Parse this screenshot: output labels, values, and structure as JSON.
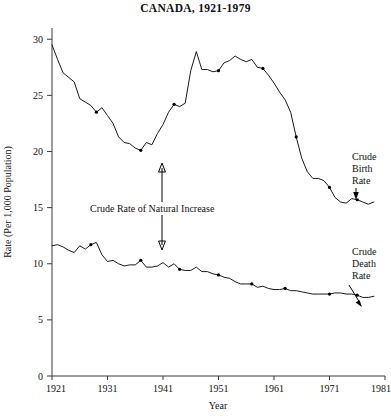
{
  "chart_data": {
    "type": "line",
    "title": "CANADA, 1921-1979",
    "xlabel": "Year",
    "ylabel": "Rate (Per 1,000 Population)",
    "xlim": [
      1921,
      1981
    ],
    "ylim": [
      0,
      31
    ],
    "grid": false,
    "legend_position": "none",
    "x_ticks": [
      "1921",
      "1931",
      "1941",
      "1951",
      "1961",
      "1971",
      "1981"
    ],
    "x_tick_values": [
      1921,
      1931,
      1941,
      1951,
      1961,
      1971,
      1981
    ],
    "y_ticks": [
      "0",
      "5",
      "10",
      "15",
      "20",
      "25",
      "30"
    ],
    "y_tick_values": [
      0,
      5,
      10,
      15,
      20,
      25,
      30
    ],
    "x": [
      1921,
      1922,
      1923,
      1924,
      1925,
      1926,
      1927,
      1928,
      1929,
      1930,
      1931,
      1932,
      1933,
      1934,
      1935,
      1936,
      1937,
      1938,
      1939,
      1940,
      1941,
      1942,
      1943,
      1944,
      1945,
      1946,
      1947,
      1948,
      1949,
      1950,
      1951,
      1952,
      1953,
      1954,
      1955,
      1956,
      1957,
      1958,
      1959,
      1960,
      1961,
      1962,
      1963,
      1964,
      1965,
      1966,
      1967,
      1968,
      1969,
      1970,
      1971,
      1972,
      1973,
      1974,
      1975,
      1976,
      1977,
      1978,
      1979
    ],
    "series": [
      {
        "name": "Crude Birth Rate",
        "values": [
          29.5,
          28.2,
          27.0,
          26.6,
          26.2,
          24.7,
          24.4,
          24.1,
          23.5,
          23.9,
          23.2,
          22.5,
          21.3,
          20.8,
          20.7,
          20.3,
          20.1,
          20.8,
          20.6,
          21.6,
          22.4,
          23.5,
          24.2,
          24.0,
          24.3,
          27.2,
          28.9,
          27.3,
          27.3,
          27.1,
          27.2,
          27.9,
          28.1,
          28.5,
          28.2,
          28.0,
          28.2,
          27.5,
          27.4,
          26.8,
          26.1,
          25.3,
          24.6,
          23.5,
          21.3,
          19.4,
          18.2,
          17.6,
          17.6,
          17.4,
          16.8,
          15.9,
          15.5,
          15.4,
          15.8,
          15.7,
          15.5,
          15.3,
          15.5
        ]
      },
      {
        "name": "Crude Death Rate",
        "values": [
          11.6,
          11.7,
          11.5,
          11.2,
          11.0,
          11.6,
          11.3,
          11.7,
          11.9,
          10.8,
          10.2,
          10.3,
          10.0,
          9.8,
          9.9,
          9.9,
          10.3,
          9.7,
          9.7,
          9.8,
          10.1,
          9.7,
          10.0,
          9.5,
          9.4,
          9.4,
          9.7,
          9.3,
          9.3,
          9.1,
          9.0,
          8.8,
          8.7,
          8.4,
          8.2,
          8.2,
          8.2,
          7.9,
          8.0,
          7.8,
          7.7,
          7.7,
          7.8,
          7.6,
          7.6,
          7.5,
          7.4,
          7.3,
          7.3,
          7.3,
          7.3,
          7.4,
          7.4,
          7.3,
          7.3,
          7.2,
          7.0,
          7.0,
          7.1
        ]
      }
    ],
    "marker_years": {
      "Crude Birth Rate": [
        1929,
        1937,
        1943,
        1951,
        1959,
        1965,
        1971,
        1976
      ],
      "Crude Death Rate": [
        1928,
        1937,
        1944,
        1951,
        1957,
        1963,
        1971,
        1976
      ]
    },
    "annotations": [
      {
        "name": "crude-birth-rate-label",
        "text": "Crude\nBirth\nRate",
        "lines": [
          "Crude",
          "Birth",
          "Rate"
        ],
        "points_to": "Crude Birth Rate curve near 1977"
      },
      {
        "name": "crude-death-rate-label",
        "text": "Crude\nDeath\nRate",
        "lines": [
          "Crude",
          "Death",
          "Rate"
        ],
        "points_to": "Crude Death Rate curve near 1978"
      },
      {
        "name": "crude-rate-of-natural-increase-label",
        "text": "Crude Rate of Natural Increase",
        "points_to": "Vertical gap between birth and death rate curves near 1939"
      }
    ]
  },
  "annotation_labels": {
    "birth_line1": "Crude",
    "birth_line2": "Birth",
    "birth_line3": "Rate",
    "death_line1": "Crude",
    "death_line2": "Death",
    "death_line3": "Rate",
    "natural_increase": "Crude Rate of Natural Increase"
  },
  "colors": {
    "line": "#1a1a1a",
    "axis": "#3a3a3a",
    "background": "#ffffff",
    "text": "#111111"
  }
}
